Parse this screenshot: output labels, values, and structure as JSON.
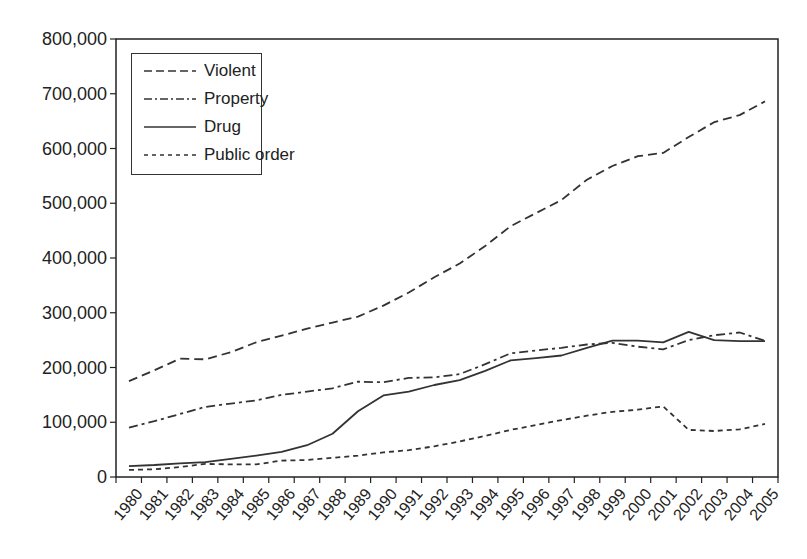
{
  "chart_data": {
    "type": "line",
    "title": "",
    "xlabel": "",
    "ylabel": "",
    "ylim": [
      0,
      800000
    ],
    "yticks": [
      0,
      100000,
      200000,
      300000,
      400000,
      500000,
      600000,
      700000,
      800000
    ],
    "ytick_labels": [
      "0",
      "100,000",
      "200,000",
      "300,000",
      "400,000",
      "500,000",
      "600,000",
      "700,000",
      "800,000"
    ],
    "x": [
      "1980",
      "1981",
      "1982",
      "1983",
      "1984",
      "1985",
      "1986",
      "1987",
      "1988",
      "1989",
      "1990",
      "1991",
      "1992",
      "1993",
      "1994",
      "1995",
      "1996",
      "1997",
      "1998",
      "1999",
      "2000",
      "2001",
      "2002",
      "2003",
      "2004",
      "2005"
    ],
    "grid": false,
    "legend_position": "upper left",
    "series": [
      {
        "name": "Violent",
        "style": "dashed",
        "values": [
          175000,
          195000,
          216000,
          215000,
          228000,
          246000,
          258000,
          271000,
          282000,
          293000,
          313000,
          337000,
          365000,
          390000,
          422000,
          458000,
          482000,
          506000,
          543000,
          568000,
          586000,
          592000,
          621000,
          648000,
          661000,
          686000
        ]
      },
      {
        "name": "Property",
        "style": "dash-dot",
        "values": [
          90000,
          102000,
          115000,
          128000,
          134000,
          140000,
          150000,
          156000,
          162000,
          174000,
          173000,
          181000,
          182000,
          188000,
          206000,
          226000,
          231000,
          236000,
          242000,
          245000,
          238000,
          233000,
          250000,
          259000,
          264000,
          249000
        ]
      },
      {
        "name": "Drug",
        "style": "solid",
        "values": [
          20000,
          22000,
          25000,
          27000,
          33000,
          39000,
          46000,
          58000,
          79000,
          120000,
          149000,
          156000,
          168000,
          177000,
          194000,
          213000,
          217000,
          222000,
          236000,
          249000,
          249000,
          246000,
          265000,
          250000,
          248000,
          248000
        ]
      },
      {
        "name": "Public order",
        "style": "dotted",
        "values": [
          13000,
          14000,
          18000,
          24000,
          23000,
          23000,
          30000,
          31000,
          35000,
          39000,
          45000,
          49000,
          56000,
          65000,
          75000,
          86000,
          95000,
          104000,
          112000,
          119000,
          123000,
          129000,
          86000,
          84000,
          87000,
          97000
        ]
      }
    ]
  },
  "legend": {
    "items": [
      {
        "label": "Violent"
      },
      {
        "label": "Property"
      },
      {
        "label": "Drug"
      },
      {
        "label": "Public order"
      }
    ]
  },
  "colors": {
    "line": "#333333",
    "axis": "#222222",
    "text": "#222222"
  }
}
